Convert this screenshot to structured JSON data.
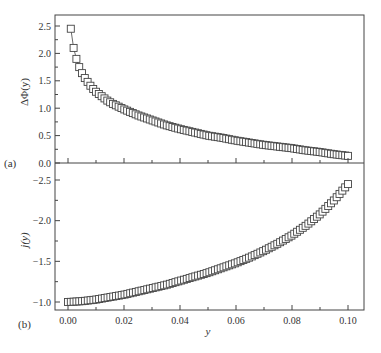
{
  "chart_data": [
    {
      "panel": "(a)",
      "type": "scatter",
      "marker": "open-square",
      "connected": true,
      "ylabel": "ΔΦ(y)",
      "xlabel": "",
      "xlim": [
        -0.004,
        0.106
      ],
      "ylim": [
        0.0,
        2.7
      ],
      "yticks": [
        0.0,
        0.5,
        1.0,
        1.5,
        2.0,
        2.5
      ],
      "ytick_labels": [
        "0.0",
        "0.5",
        "1.0",
        "1.5",
        "2.0",
        "2.5"
      ],
      "x": [
        0.001,
        0.002,
        0.003,
        0.004,
        0.005,
        0.006,
        0.007,
        0.008,
        0.009,
        0.01,
        0.012,
        0.014,
        0.016,
        0.018,
        0.02,
        0.025,
        0.03,
        0.035,
        0.04,
        0.045,
        0.05,
        0.055,
        0.06,
        0.065,
        0.07,
        0.075,
        0.08,
        0.085,
        0.09,
        0.095,
        0.1
      ],
      "y": [
        2.45,
        2.1,
        1.9,
        1.75,
        1.64,
        1.55,
        1.48,
        1.41,
        1.35,
        1.3,
        1.22,
        1.14,
        1.08,
        1.03,
        0.98,
        0.87,
        0.78,
        0.69,
        0.62,
        0.56,
        0.5,
        0.46,
        0.41,
        0.37,
        0.33,
        0.3,
        0.27,
        0.23,
        0.2,
        0.16,
        0.13
      ]
    },
    {
      "panel": "(b)",
      "type": "scatter",
      "marker": "open-square",
      "connected": true,
      "ylabel": "j(y)",
      "xlabel": "y",
      "xlim": [
        -0.004,
        0.106
      ],
      "ylim": [
        -0.95,
        -2.65
      ],
      "y_inverted": true,
      "yticks": [
        -1.0,
        -1.5,
        -2.0,
        -2.5
      ],
      "ytick_labels": [
        "−1.0",
        "−1.5",
        "−2.0",
        "−2.5"
      ],
      "xticks": [
        0.0,
        0.02,
        0.04,
        0.06,
        0.08,
        0.1
      ],
      "xtick_labels": [
        "0.00",
        "0.02",
        "0.04",
        "0.06",
        "0.08",
        "0.10"
      ],
      "x": [
        0.0,
        0.005,
        0.01,
        0.015,
        0.02,
        0.025,
        0.03,
        0.035,
        0.04,
        0.045,
        0.05,
        0.055,
        0.06,
        0.065,
        0.07,
        0.075,
        0.08,
        0.085,
        0.09,
        0.095,
        0.1
      ],
      "y": [
        -1.0,
        -1.01,
        -1.03,
        -1.06,
        -1.09,
        -1.13,
        -1.17,
        -1.21,
        -1.26,
        -1.31,
        -1.36,
        -1.42,
        -1.48,
        -1.55,
        -1.63,
        -1.72,
        -1.82,
        -1.94,
        -2.08,
        -2.25,
        -2.45
      ]
    }
  ],
  "labels": {
    "panel_a": "(a)",
    "panel_b": "(b)",
    "ylabel_a": "ΔΦ(y)",
    "ylabel_b": "j(y)",
    "xlabel": "y"
  }
}
